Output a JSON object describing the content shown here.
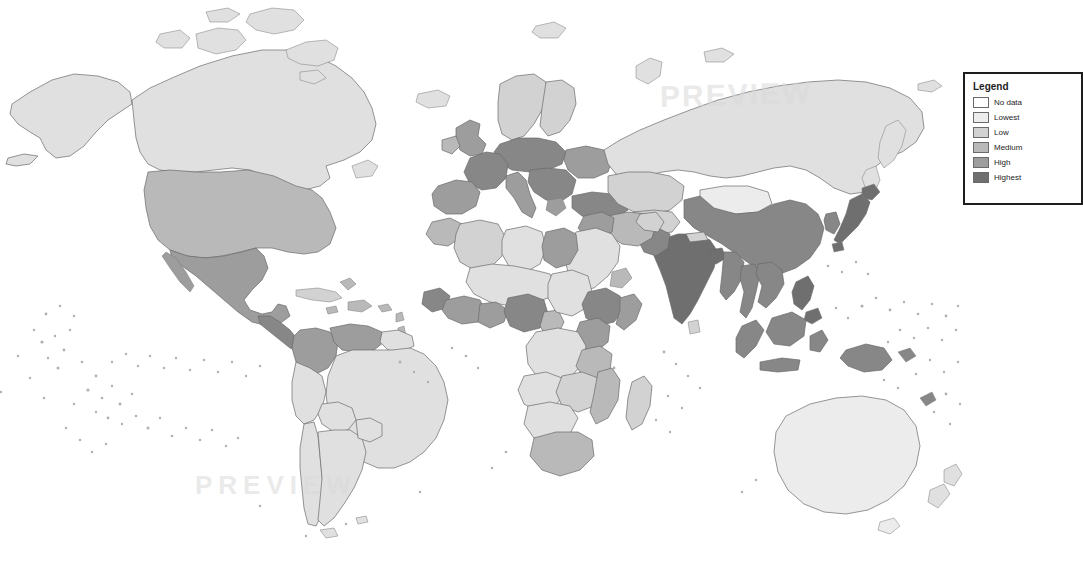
{
  "page": {
    "kind": "world-choropleth-map",
    "width": 977,
    "height": 573,
    "background_color": "#ffffff",
    "border_color": "#6a6a6a"
  },
  "watermark": {
    "top_text": "PREVIEW",
    "bottom_text": "PREVIEW"
  },
  "legend": {
    "title": "Legend",
    "clipped_at_right_edge": true,
    "border_color": "#1d1d1d",
    "entries": [
      {
        "label": "No data",
        "color": "#ffffff"
      },
      {
        "label": "Lowest",
        "color": "#ececec"
      },
      {
        "label": "Low",
        "color": "#d2d2d2"
      },
      {
        "label": "Medium",
        "color": "#b9b9b9"
      },
      {
        "label": "High",
        "color": "#9d9d9d"
      },
      {
        "label": "Highest",
        "color": "#6f6f6f"
      }
    ]
  },
  "chart_data": {
    "type": "map",
    "title": "",
    "subtitle": "",
    "projection": "equirectangular-like world map",
    "legend_position": "right",
    "color_scale": {
      "type": "sequential-grayscale",
      "stops": [
        "#ececec",
        "#e0e0e0",
        "#d2d2d2",
        "#b9b9b9",
        "#9d9d9d",
        "#878787",
        "#6f6f6f"
      ],
      "no_data_color": "#ffffff"
    },
    "regions": [
      {
        "name": "Canada",
        "bin": 1,
        "color": "#e0e0e0"
      },
      {
        "name": "Greenland",
        "bin": 1,
        "color": "#e0e0e0"
      },
      {
        "name": "Alaska",
        "bin": 1,
        "color": "#e0e0e0"
      },
      {
        "name": "United States",
        "bin": 3,
        "color": "#b9b9b9"
      },
      {
        "name": "Mexico",
        "bin": 4,
        "color": "#9d9d9d"
      },
      {
        "name": "Central America",
        "bin": 5,
        "color": "#878787"
      },
      {
        "name": "Cuba",
        "bin": 2,
        "color": "#d2d2d2"
      },
      {
        "name": "Caribbean",
        "bin": 3,
        "color": "#b9b9b9"
      },
      {
        "name": "Colombia",
        "bin": 4,
        "color": "#9d9d9d"
      },
      {
        "name": "Venezuela",
        "bin": 4,
        "color": "#9d9d9d"
      },
      {
        "name": "Brazil",
        "bin": 1,
        "color": "#e0e0e0"
      },
      {
        "name": "Peru",
        "bin": 1,
        "color": "#e0e0e0"
      },
      {
        "name": "Bolivia",
        "bin": 1,
        "color": "#e0e0e0"
      },
      {
        "name": "Argentina",
        "bin": 1,
        "color": "#e0e0e0"
      },
      {
        "name": "Chile",
        "bin": 1,
        "color": "#e0e0e0"
      },
      {
        "name": "United Kingdom",
        "bin": 4,
        "color": "#9d9d9d"
      },
      {
        "name": "Ireland",
        "bin": 3,
        "color": "#b9b9b9"
      },
      {
        "name": "France",
        "bin": 5,
        "color": "#878787"
      },
      {
        "name": "Spain",
        "bin": 4,
        "color": "#9d9d9d"
      },
      {
        "name": "Portugal",
        "bin": 4,
        "color": "#9d9d9d"
      },
      {
        "name": "Germany",
        "bin": 5,
        "color": "#878787"
      },
      {
        "name": "Poland",
        "bin": 5,
        "color": "#878787"
      },
      {
        "name": "Italy",
        "bin": 4,
        "color": "#9d9d9d"
      },
      {
        "name": "Balkans",
        "bin": 5,
        "color": "#878787"
      },
      {
        "name": "Scandinavia",
        "bin": 2,
        "color": "#d2d2d2"
      },
      {
        "name": "Ukraine",
        "bin": 4,
        "color": "#9d9d9d"
      },
      {
        "name": "Turkey",
        "bin": 5,
        "color": "#878787"
      },
      {
        "name": "Russia",
        "bin": 1,
        "color": "#e0e0e0"
      },
      {
        "name": "Kazakhstan",
        "bin": 2,
        "color": "#d2d2d2"
      },
      {
        "name": "Mongolia",
        "bin": 0,
        "color": "#ececec"
      },
      {
        "name": "China",
        "bin": 5,
        "color": "#878787"
      },
      {
        "name": "Japan",
        "bin": 6,
        "color": "#6f6f6f"
      },
      {
        "name": "Korea",
        "bin": 5,
        "color": "#878787"
      },
      {
        "name": "India",
        "bin": 6,
        "color": "#6f6f6f"
      },
      {
        "name": "Pakistan",
        "bin": 5,
        "color": "#878787"
      },
      {
        "name": "Bangladesh",
        "bin": 6,
        "color": "#6f6f6f"
      },
      {
        "name": "Iran",
        "bin": 3,
        "color": "#b9b9b9"
      },
      {
        "name": "Iraq",
        "bin": 4,
        "color": "#9d9d9d"
      },
      {
        "name": "Saudi Arabia",
        "bin": 1,
        "color": "#e0e0e0"
      },
      {
        "name": "Egypt",
        "bin": 4,
        "color": "#9d9d9d"
      },
      {
        "name": "Libya",
        "bin": 1,
        "color": "#e0e0e0"
      },
      {
        "name": "Algeria",
        "bin": 2,
        "color": "#d2d2d2"
      },
      {
        "name": "Morocco",
        "bin": 3,
        "color": "#b9b9b9"
      },
      {
        "name": "Nigeria",
        "bin": 5,
        "color": "#878787"
      },
      {
        "name": "Ghana",
        "bin": 4,
        "color": "#9d9d9d"
      },
      {
        "name": "Senegal",
        "bin": 5,
        "color": "#878787"
      },
      {
        "name": "Ethiopia",
        "bin": 5,
        "color": "#878787"
      },
      {
        "name": "Kenya",
        "bin": 4,
        "color": "#9d9d9d"
      },
      {
        "name": "Tanzania",
        "bin": 3,
        "color": "#b9b9b9"
      },
      {
        "name": "DR Congo",
        "bin": 1,
        "color": "#e0e0e0"
      },
      {
        "name": "South Africa",
        "bin": 3,
        "color": "#b9b9b9"
      },
      {
        "name": "Madagascar",
        "bin": 2,
        "color": "#d2d2d2"
      },
      {
        "name": "Indonesia",
        "bin": 5,
        "color": "#878787"
      },
      {
        "name": "Philippines",
        "bin": 6,
        "color": "#6f6f6f"
      },
      {
        "name": "Malaysia",
        "bin": 5,
        "color": "#878787"
      },
      {
        "name": "Vietnam",
        "bin": 5,
        "color": "#878787"
      },
      {
        "name": "Thailand",
        "bin": 5,
        "color": "#878787"
      },
      {
        "name": "Papua New Guinea",
        "bin": 5,
        "color": "#878787"
      },
      {
        "name": "Australia",
        "bin": 0,
        "color": "#ececec"
      },
      {
        "name": "New Zealand",
        "bin": 1,
        "color": "#e0e0e0"
      }
    ]
  }
}
